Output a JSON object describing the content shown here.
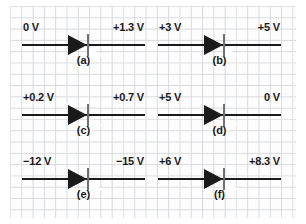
{
  "figure": {
    "background": "graph-paper",
    "grid_color": "#d6d8db",
    "ink_color": "#1a1a1a",
    "cathode_bar_color": "#6f7275"
  },
  "circuits": [
    {
      "id": "a",
      "caption": "(a)",
      "left_voltage": "0 V",
      "right_voltage": "+1.3 V",
      "diode_direction": "right",
      "column": "left",
      "row": 1
    },
    {
      "id": "b",
      "caption": "(b)",
      "left_voltage": "+3 V",
      "right_voltage": "+5 V",
      "diode_direction": "right",
      "column": "right",
      "row": 1
    },
    {
      "id": "c",
      "caption": "(c)",
      "left_voltage": "+0.2 V",
      "right_voltage": "+0.7 V",
      "diode_direction": "right",
      "column": "left",
      "row": 2
    },
    {
      "id": "d",
      "caption": "(d)",
      "left_voltage": "+5 V",
      "right_voltage": "0 V",
      "diode_direction": "right",
      "column": "right",
      "row": 2
    },
    {
      "id": "e",
      "caption": "(e)",
      "left_voltage": "−12 V",
      "right_voltage": "−15 V",
      "diode_direction": "right",
      "column": "left",
      "row": 3
    },
    {
      "id": "f",
      "caption": "(f)",
      "left_voltage": "+6 V",
      "right_voltage": "+8.3 V",
      "diode_direction": "right",
      "column": "right",
      "row": 3
    }
  ]
}
